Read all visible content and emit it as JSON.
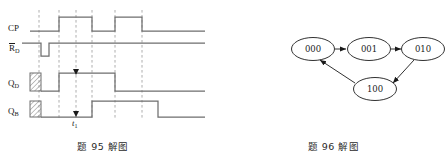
{
  "figures": {
    "left": {
      "caption": "题 95 解图",
      "signals": [
        {
          "id": "cp",
          "label": "CP",
          "overline": false,
          "sub": ""
        },
        {
          "id": "rd",
          "label": "R",
          "overline": true,
          "sub": "D"
        },
        {
          "id": "qd",
          "label": "Q",
          "overline": false,
          "sub": "D"
        },
        {
          "id": "qb",
          "label": "Q",
          "overline": false,
          "sub": "B"
        }
      ],
      "time_marker": {
        "label": "t",
        "sub": "1",
        "x": 76
      },
      "waveform_data": {
        "type": "timing",
        "xlim": [
          30,
          205
        ],
        "grid_lines_x": [
          39,
          59,
          76,
          92,
          115,
          142
        ],
        "traces": [
          {
            "name": "CP",
            "baseline_y": 31,
            "high_y": 17,
            "segments": [
              [
                30,
                0
              ],
              [
                59,
                1
              ],
              [
                76,
                1
              ],
              [
                92,
                0
              ],
              [
                115,
                1
              ],
              [
                142,
                1
              ],
              [
                142,
                0
              ],
              [
                205,
                0
              ]
            ],
            "description": "clock: low until 59, high 59-92, low 92-115, high 115-142, low after"
          },
          {
            "name": "RD",
            "baseline_y": 53,
            "high_y": 43,
            "segments": [
              [
                30,
                1
              ],
              [
                41,
                0
              ],
              [
                49,
                1
              ],
              [
                205,
                1
              ]
            ],
            "description": "active-low reset: brief low pulse between 41 and 49"
          },
          {
            "name": "QD",
            "baseline_y": 91,
            "high_y": 73,
            "hatch": {
              "x": 30,
              "w": 11
            },
            "segments": [
              [
                41,
                0
              ],
              [
                59,
                1
              ],
              [
                115,
                1
              ],
              [
                115,
                0
              ],
              [
                205,
                0
              ]
            ],
            "description": "low after reset, high 59-115, low after"
          },
          {
            "name": "QB",
            "baseline_y": 117,
            "high_y": 101,
            "hatch": {
              "x": 30,
              "w": 11
            },
            "segments": [
              [
                41,
                0
              ],
              [
                92,
                0
              ],
              [
                92,
                1
              ],
              [
                158,
                1
              ],
              [
                158,
                0
              ],
              [
                205,
                0
              ]
            ],
            "description": "low after reset, high 92-158, low after"
          }
        ],
        "arrow_markers": [
          {
            "trace": "QD",
            "x": 76,
            "y": 73,
            "direction": "down"
          },
          {
            "trace": "QB",
            "x": 76,
            "y": 114,
            "direction": "down"
          }
        ]
      }
    },
    "right": {
      "caption": "题 96 解图",
      "state_diagram": {
        "type": "state-transition",
        "nodes": [
          {
            "id": "s000",
            "label": "000",
            "cx": 313,
            "cy": 49
          },
          {
            "id": "s001",
            "label": "001",
            "cx": 369,
            "cy": 49
          },
          {
            "id": "s010",
            "label": "010",
            "cx": 424,
            "cy": 49
          },
          {
            "id": "s100",
            "label": "100",
            "cx": 375,
            "cy": 89
          }
        ],
        "edges": [
          {
            "from": "000",
            "to": "001"
          },
          {
            "from": "001",
            "to": "010"
          },
          {
            "from": "010",
            "to": "100"
          },
          {
            "from": "100",
            "to": "000"
          }
        ]
      }
    }
  },
  "colors": {
    "background": "#ffffff",
    "ink": "#1a1a1a",
    "wave": "#6e6e6e",
    "dash": "#8a8a8a"
  }
}
